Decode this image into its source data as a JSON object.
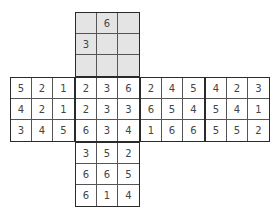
{
  "net": {
    "faces": [
      {
        "id": "top",
        "shaded": true,
        "x": 75,
        "y": 12,
        "cells": [
          "",
          "6",
          "",
          "3",
          "",
          "",
          "",
          "",
          ""
        ]
      },
      {
        "id": "left",
        "shaded": false,
        "x": 10,
        "y": 77,
        "cells": [
          "5",
          "2",
          "1",
          "4",
          "2",
          "1",
          "3",
          "4",
          "5"
        ]
      },
      {
        "id": "front",
        "shaded": false,
        "x": 75,
        "y": 77,
        "cells": [
          "2",
          "3",
          "6",
          "2",
          "3",
          "3",
          "6",
          "3",
          "4"
        ]
      },
      {
        "id": "right",
        "shaded": false,
        "x": 140,
        "y": 77,
        "cells": [
          "2",
          "4",
          "5",
          "6",
          "5",
          "4",
          "1",
          "6",
          "6"
        ]
      },
      {
        "id": "back",
        "shaded": false,
        "x": 205,
        "y": 77,
        "cells": [
          "4",
          "2",
          "3",
          "5",
          "4",
          "1",
          "5",
          "5",
          "2"
        ]
      },
      {
        "id": "bottom",
        "shaded": false,
        "x": 75,
        "y": 142,
        "cells": [
          "3",
          "5",
          "2",
          "6",
          "6",
          "5",
          "6",
          "1",
          "4"
        ]
      }
    ]
  }
}
